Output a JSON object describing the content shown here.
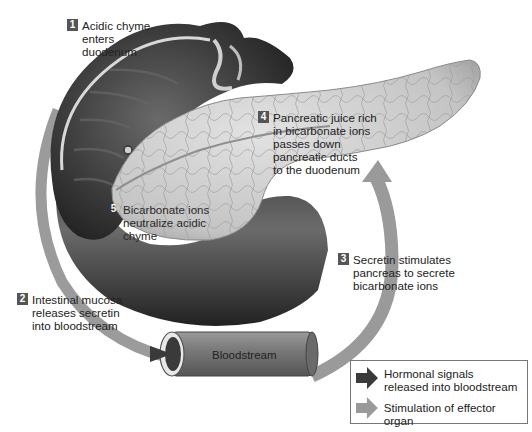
{
  "diagram": {
    "steps": [
      {
        "number": "1",
        "text": "Acidic chyme\nenters\nduodenum"
      },
      {
        "number": "2",
        "text": "Intestinal mucosa\nreleases secretin\ninto bloodstream"
      },
      {
        "number": "3",
        "text": "Secretin stimulates\npancreas to secrete\nbicarbonate ions"
      },
      {
        "number": "4",
        "text": "Pancreatic juice rich\nin bicarbonate ions\npasses down\npancreatic ducts\nto the duodenum"
      },
      {
        "number": "5",
        "text": "Bicarbonate ions\nneutralize acidic\nchyme"
      }
    ],
    "vessel_label": "Bloodstream",
    "structures": [
      "stomach",
      "duodenum",
      "pancreas",
      "blood vessel"
    ]
  },
  "legend": {
    "items": [
      {
        "icon": "dark-arrow-icon",
        "color": "#3a3a3a",
        "text": "Hormonal signals\nreleased into bloodstream"
      },
      {
        "icon": "light-arrow-icon",
        "color": "#9a9a9a",
        "text": "Stimulation of effector organ"
      }
    ]
  },
  "colors": {
    "hormonal_arrow": "#3a3a3a",
    "stimulation_arrow": "#9a9a9a",
    "number_badge": "#555555",
    "organ_dark": "#2e2e2e",
    "pancreas": "#c9c9c9"
  }
}
